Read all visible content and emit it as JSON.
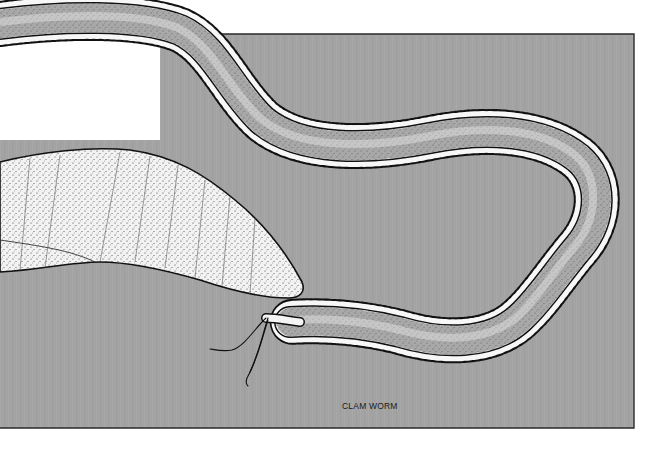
{
  "illustration": {
    "subject": "clam worm",
    "caption": "CLAM WORM",
    "colors": {
      "page_background": "#ffffff",
      "panel_fill": "#a3a3a3",
      "panel_border": "#2a2a2a",
      "body_fill": "#f4f4f4",
      "stipple": "#3a3a3a",
      "outline": "#111111"
    }
  }
}
